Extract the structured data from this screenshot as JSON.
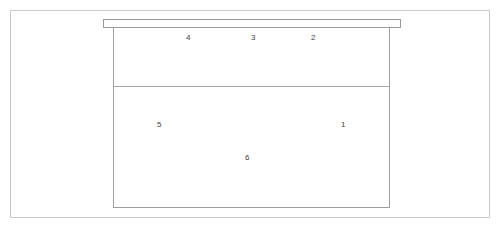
{
  "diagram": {
    "background_color": "#ffffff",
    "line_color": "#9e9e9e",
    "frame_color": "#c9c9c9",
    "label_color": "#3b3b3b",
    "shapes": {
      "outer_frame_name": "outer-frame",
      "top_rail_name": "top-rail",
      "main_box_name": "main-box",
      "divider_name": "divider"
    },
    "callouts": [
      {
        "id": "callout-4",
        "label": "4",
        "x": 186,
        "y": 33
      },
      {
        "id": "callout-3",
        "label": "3",
        "x": 251,
        "y": 33
      },
      {
        "id": "callout-2",
        "label": "2",
        "x": 311,
        "y": 33
      },
      {
        "id": "callout-5",
        "label": "5",
        "x": 157,
        "y": 120
      },
      {
        "id": "callout-1",
        "label": "1",
        "x": 341,
        "y": 120
      },
      {
        "id": "callout-6",
        "label": "6",
        "x": 245,
        "y": 153
      }
    ]
  }
}
